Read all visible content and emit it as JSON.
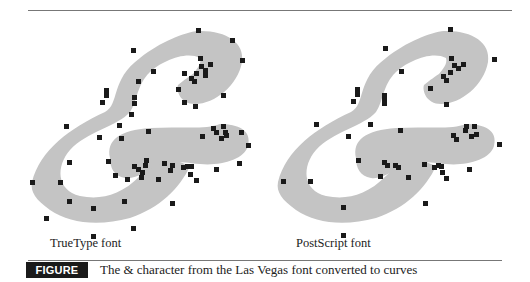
{
  "figure": {
    "label": "FIGURE 32-1",
    "caption": "The & character from the Las Vegas font converted to curves",
    "panels": [
      {
        "label": "TrueType font"
      },
      {
        "label": "PostScript font"
      }
    ]
  },
  "colors": {
    "glyph_fill": "#c4c4c4",
    "control_point": "#1a1a1a",
    "label_bg": "#1a1a1a",
    "rule": "#777777"
  }
}
